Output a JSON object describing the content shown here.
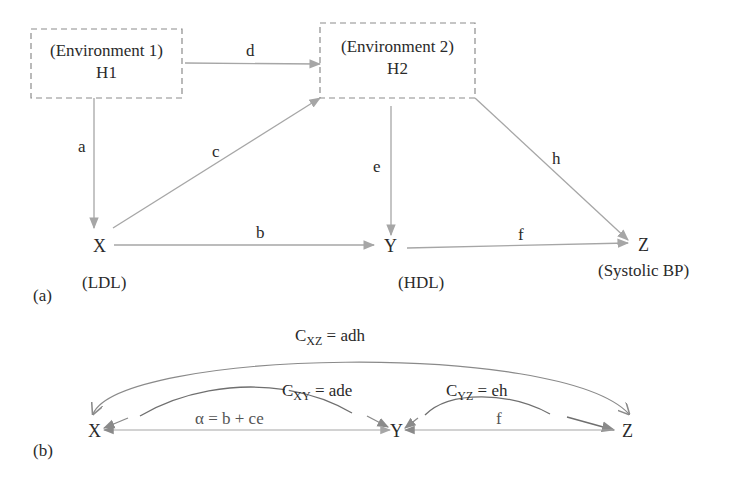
{
  "panel_a": {
    "tag": "(a)",
    "env1": {
      "title": "(Environment 1)",
      "name": "H1"
    },
    "env2": {
      "title": "(Environment 2)",
      "name": "H2"
    },
    "nodes": {
      "x": {
        "symbol": "X",
        "label": "(LDL)"
      },
      "y": {
        "symbol": "Y",
        "label": "(HDL)"
      },
      "z": {
        "symbol": "Z",
        "label": "(Systolic BP)"
      }
    },
    "paths": {
      "a": "a",
      "b": "b",
      "c": "c",
      "d": "d",
      "e": "e",
      "f": "f",
      "h": "h"
    }
  },
  "panel_b": {
    "tag": "(b)",
    "nodes": {
      "x": "X",
      "y": "Y",
      "z": "Z"
    },
    "cxz": {
      "c": "C",
      "sub": "XZ",
      "rhs": " = adh"
    },
    "cxy": {
      "c": "C",
      "sub": "XY",
      "rhs": " = ade"
    },
    "cyz": {
      "c": "C",
      "sub": "YZ",
      "rhs": " = eh"
    },
    "alpha": "α = b + ce",
    "f": "f"
  },
  "colors": {
    "line": "#a6a6a6",
    "box": "#8c8c8c",
    "text": "#2a2a2a",
    "curve": "#7a7a7a"
  }
}
